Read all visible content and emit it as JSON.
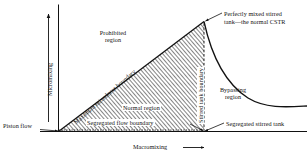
{
  "figure": {
    "type": "diagram",
    "axes": {
      "y_label": "Micromixing",
      "x_label": "Macromixing",
      "y_arrow": "up-arrow",
      "x_arrow": "right-arrow"
    },
    "regions": [
      {
        "id": "prohibited",
        "label_line1": "Prohibited",
        "label_line2": "region"
      },
      {
        "id": "normal",
        "label": "Normal region"
      },
      {
        "id": "bypassing",
        "label_line1": "Bypassing",
        "label_line2": "region"
      }
    ],
    "boundaries": [
      {
        "id": "maximum-mixedness",
        "label": "Maximum mixedness boundary"
      },
      {
        "id": "segregated-flow",
        "label": "Segregated flow boundary"
      },
      {
        "id": "stirred-tank",
        "label": "Stirred tank boundary"
      }
    ],
    "points": [
      {
        "id": "piston-flow",
        "label": "Piston flow"
      },
      {
        "id": "perfectly-mixed-cstr",
        "label_line1": "Perfectly mixed stirred",
        "label_line2": "tank—the normal CSTR"
      },
      {
        "id": "segregated-stirred-tank",
        "label": "Segregated stirred tank"
      }
    ],
    "colors": {
      "ink": "#111111",
      "background": "#ffffff",
      "hatch": "#2a2a2a"
    }
  }
}
